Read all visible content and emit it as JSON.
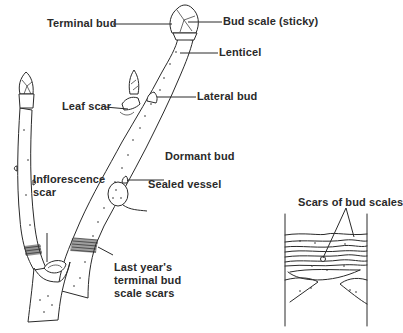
{
  "diagram": {
    "main_twig_labels": {
      "terminal_bud": "Terminal bud",
      "bud_scale": "Bud scale (sticky)",
      "lenticel": "Lenticel",
      "lateral_bud": "Lateral bud",
      "leaf_scar": "Leaf scar",
      "dormant_bud": "Dormant bud",
      "sealed_vessel": "Sealed vessel",
      "inflorescence_scar": "Inflorescence\nscar",
      "last_years_scars": "Last year's\nterminal bud\nscale scars"
    },
    "detail_inset": {
      "label": "Scars of bud scales"
    },
    "colors": {
      "ink": "#2a2a2a",
      "background": "#ffffff"
    }
  }
}
